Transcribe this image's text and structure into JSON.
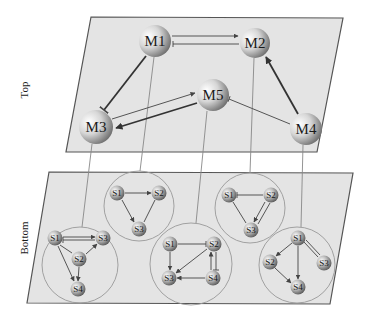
{
  "labels": {
    "top": "Top",
    "bottom": "Bottom"
  },
  "top_layer": {
    "nodes": [
      {
        "id": "M1",
        "label": "M1",
        "x": 155,
        "y": 41,
        "r": 16
      },
      {
        "id": "M2",
        "label": "M2",
        "x": 255,
        "y": 43,
        "r": 15
      },
      {
        "id": "M3",
        "label": "M3",
        "x": 96,
        "y": 127,
        "r": 17
      },
      {
        "id": "M4",
        "label": "M4",
        "x": 306,
        "y": 129,
        "r": 16
      },
      {
        "id": "M5",
        "label": "M5",
        "x": 213,
        "y": 95,
        "r": 16
      }
    ],
    "edges": [
      {
        "from": "M1",
        "to": "M2",
        "type": "activation"
      },
      {
        "from": "M2",
        "to": "M1",
        "type": "inhibition"
      },
      {
        "from": "M1",
        "to": "M3",
        "type": "inhibition"
      },
      {
        "from": "M3",
        "to": "M5",
        "type": "activation"
      },
      {
        "from": "M5",
        "to": "M3",
        "type": "activation"
      },
      {
        "from": "M4",
        "to": "M2",
        "type": "activation"
      },
      {
        "from": "M4",
        "to": "M5",
        "type": "inhibition"
      }
    ]
  },
  "bottom_layer": {
    "clusters": [
      {
        "module": "M3",
        "cx": 80,
        "cy": 265,
        "r": 38,
        "nodes": [
          {
            "label": "S1",
            "x": 55,
            "y": 238
          },
          {
            "label": "S3",
            "x": 103,
            "y": 238
          },
          {
            "label": "S2",
            "x": 79,
            "y": 259
          },
          {
            "label": "S4",
            "x": 78,
            "y": 289
          }
        ]
      },
      {
        "module": "M1",
        "cx": 139,
        "cy": 206,
        "r": 35,
        "nodes": [
          {
            "label": "S1",
            "x": 117,
            "y": 193
          },
          {
            "label": "S2",
            "x": 159,
            "y": 193
          },
          {
            "label": "S3",
            "x": 139,
            "y": 229
          }
        ]
      },
      {
        "module": "M5",
        "cx": 191,
        "cy": 264,
        "r": 41,
        "nodes": [
          {
            "label": "S1",
            "x": 170,
            "y": 244
          },
          {
            "label": "S2",
            "x": 214,
            "y": 244
          },
          {
            "label": "S3",
            "x": 169,
            "y": 278
          },
          {
            "label": "S4",
            "x": 213,
            "y": 278
          }
        ]
      },
      {
        "module": "M2",
        "cx": 250,
        "cy": 208,
        "r": 35,
        "nodes": [
          {
            "label": "S1",
            "x": 229,
            "y": 195
          },
          {
            "label": "S2",
            "x": 271,
            "y": 195
          },
          {
            "label": "S3",
            "x": 251,
            "y": 230
          }
        ]
      },
      {
        "module": "M4",
        "cx": 297,
        "cy": 265,
        "r": 38,
        "nodes": [
          {
            "label": "S1",
            "x": 298,
            "y": 238
          },
          {
            "label": "S2",
            "x": 270,
            "y": 262
          },
          {
            "label": "S3",
            "x": 324,
            "y": 263
          },
          {
            "label": "S4",
            "x": 298,
            "y": 287
          }
        ]
      }
    ]
  },
  "colors": {
    "plane_fill": "#e4e4e4",
    "plane_stroke": "#555555",
    "node_light": "#ffffff",
    "node_dark": "#6e6e6e"
  }
}
